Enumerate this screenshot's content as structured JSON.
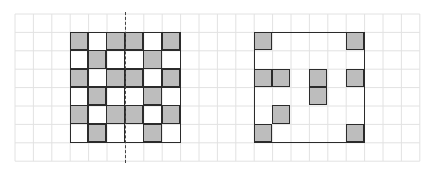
{
  "diagram": {
    "title": "",
    "colors": {
      "background": "#ffffff",
      "grid_line": "#e2e2e2",
      "figure_border": "#2b2b2b",
      "shaded_cell": "#bdbdbd",
      "symmetry_axis": "#444444"
    },
    "background_grid": {
      "origin_x": 15,
      "origin_y": 14,
      "cell_size": 18.4,
      "columns": 22,
      "rows": 8
    },
    "figures": [
      {
        "name": "left-pattern-square",
        "grid_col": 3,
        "grid_row": 1,
        "size": 6,
        "has_symmetry_axis": true,
        "symmetry_axis": {
          "orientation": "vertical",
          "style": "dashed",
          "at_column_offset": 3
        },
        "cells": [
          [
            1,
            0,
            1,
            1,
            0,
            1
          ],
          [
            0,
            1,
            0,
            0,
            1,
            0
          ],
          [
            1,
            0,
            1,
            1,
            0,
            1
          ],
          [
            0,
            1,
            0,
            0,
            1,
            0
          ],
          [
            1,
            0,
            1,
            1,
            0,
            1
          ],
          [
            0,
            1,
            0,
            0,
            1,
            0
          ]
        ],
        "show_inner_lines": true
      },
      {
        "name": "right-pattern-square",
        "grid_col": 13,
        "grid_row": 1,
        "size": 6,
        "has_symmetry_axis": false,
        "cells": [
          [
            1,
            0,
            0,
            0,
            0,
            1
          ],
          [
            0,
            0,
            0,
            0,
            0,
            0
          ],
          [
            1,
            1,
            0,
            1,
            0,
            1
          ],
          [
            0,
            0,
            0,
            1,
            0,
            0
          ],
          [
            0,
            1,
            0,
            0,
            0,
            0
          ],
          [
            1,
            0,
            0,
            0,
            0,
            1
          ]
        ],
        "show_inner_lines": false
      }
    ]
  }
}
